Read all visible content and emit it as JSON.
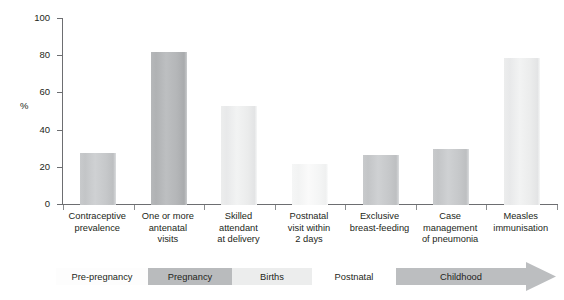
{
  "chart_data": {
    "type": "bar",
    "title": "",
    "xlabel": "",
    "ylabel": "%",
    "ylim": [
      0,
      100
    ],
    "yticks": [
      0,
      20,
      40,
      60,
      80,
      100
    ],
    "ytick_labels": [
      "0",
      "20",
      "40",
      "60",
      "80",
      "100"
    ],
    "grid": false,
    "legend": null,
    "categories": [
      "Contraceptive\nprevalence",
      "One or more\nantenatal\nvisits",
      "Skilled\nattendant\nat delivery",
      "Postnatal\nvisit within\n2 days",
      "Exclusive\nbreast-feeding",
      "Case\nmanagement\nof pneumonia",
      "Measles\nimmunisation"
    ],
    "category_lines": [
      [
        "Contraceptive",
        "prevalence"
      ],
      [
        "One or more",
        "antenatal",
        "visits"
      ],
      [
        "Skilled",
        "attendant",
        "at delivery"
      ],
      [
        "Postnatal",
        "visit within",
        "2 days"
      ],
      [
        "Exclusive",
        "breast-feeding"
      ],
      [
        "Case",
        "management",
        "of pneumonia"
      ],
      [
        "Measles",
        "immunisation"
      ]
    ],
    "values": [
      28,
      82,
      53,
      22,
      27,
      30,
      79
    ],
    "bar_shades": [
      "mid",
      "dark",
      "light",
      "faint",
      "mid",
      "mid",
      "light"
    ],
    "bar_colors": [
      "#c8cacc",
      "#b6b8ba",
      "#eceded",
      "#f5f6f6",
      "#c8cacc",
      "#c8cacc",
      "#d8d9da"
    ]
  },
  "stages": {
    "label": "life-stage continuum",
    "segments": [
      {
        "label": "Pre-pregnancy",
        "fill": "#fdfdfd"
      },
      {
        "label": "Pregnancy",
        "fill": "#b9bbbd"
      },
      {
        "label": "Births",
        "fill": "#eceded"
      },
      {
        "label": "Postnatal",
        "fill": "#ffffff"
      },
      {
        "label": "Childhood",
        "fill": "#bcbec0"
      }
    ],
    "arrow_color": "#bcbec0"
  },
  "axis": {
    "y_title": "%",
    "axis_color": "#6d6e71"
  }
}
